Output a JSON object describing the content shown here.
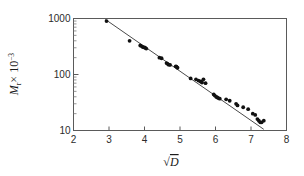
{
  "figure": {
    "background": "#ffffff",
    "point_color": "#111111",
    "line_color": "#4a4a4a",
    "axis_color": "#5a5a5a"
  },
  "chart_data": {
    "type": "scatter",
    "title": "",
    "subtitle": "",
    "xlabel": "√D",
    "xlabel_parts": {
      "radical": "√",
      "variable": "D"
    },
    "ylabel": "Mr x 10-3",
    "ylabel_parts": {
      "symbol": "M",
      "subscript": "r",
      "times": "× 10",
      "exponent": "−3"
    },
    "xscale": "linear",
    "yscale": "log",
    "xlim": [
      2,
      8
    ],
    "ylim": [
      10,
      1000
    ],
    "grid": false,
    "legend": null,
    "xticks": [
      2,
      3,
      4,
      5,
      6,
      7,
      8
    ],
    "xticklabels": [
      "2",
      "3",
      "4",
      "5",
      "6",
      "7",
      "8"
    ],
    "yticks": [
      10,
      100,
      1000
    ],
    "yticklabels": [
      "10",
      "100",
      "1000"
    ],
    "y_minor_ticks": [
      20,
      30,
      40,
      50,
      60,
      70,
      80,
      90,
      200,
      300,
      400,
      500,
      600,
      700,
      800,
      900
    ],
    "series": [
      {
        "name": "data",
        "marker": "filled-circle",
        "x": [
          2.93,
          3.58,
          3.88,
          3.9,
          3.95,
          4.0,
          4.02,
          4.05,
          4.42,
          4.48,
          4.62,
          4.65,
          4.68,
          4.72,
          4.88,
          4.9,
          4.93,
          5.3,
          5.45,
          5.52,
          5.58,
          5.62,
          5.66,
          5.72,
          5.95,
          5.98,
          6.02,
          6.05,
          6.08,
          6.12,
          6.3,
          6.4,
          6.58,
          6.62,
          6.78,
          6.92,
          7.05,
          7.12,
          7.18,
          7.22,
          7.26,
          7.3,
          7.36
        ],
        "y": [
          900,
          400,
          330,
          325,
          310,
          305,
          300,
          290,
          200,
          195,
          160,
          155,
          150,
          148,
          140,
          138,
          132,
          85,
          82,
          78,
          75,
          72,
          82,
          70,
          44,
          42,
          40,
          39,
          38,
          37,
          36,
          34,
          30,
          28,
          26,
          24,
          20,
          19,
          16,
          15,
          14,
          14,
          15
        ]
      }
    ],
    "fit_line": {
      "name": "linear fit on log scale",
      "x_start": 2.9,
      "y_start": 960,
      "x_end": 7.36,
      "y_end": 10.5
    }
  }
}
